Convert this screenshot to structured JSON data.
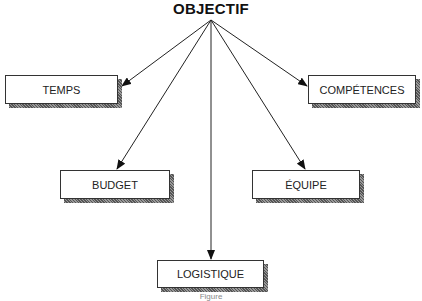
{
  "diagram": {
    "root": {
      "label": "OBJECTIF"
    },
    "nodes": [
      {
        "id": "temps",
        "label": "TEMPS"
      },
      {
        "id": "competences",
        "label": "COMPÉTENCES"
      },
      {
        "id": "budget",
        "label": "BUDGET"
      },
      {
        "id": "equipe",
        "label": "ÉQUIPE"
      },
      {
        "id": "logistique",
        "label": "LOGISTIQUE"
      }
    ],
    "edges": [
      {
        "from": "OBJECTIF",
        "to": "TEMPS"
      },
      {
        "from": "OBJECTIF",
        "to": "COMPÉTENCES"
      },
      {
        "from": "OBJECTIF",
        "to": "BUDGET"
      },
      {
        "from": "OBJECTIF",
        "to": "ÉQUIPE"
      },
      {
        "from": "OBJECTIF",
        "to": "LOGISTIQUE"
      }
    ],
    "caption": "Figure"
  }
}
